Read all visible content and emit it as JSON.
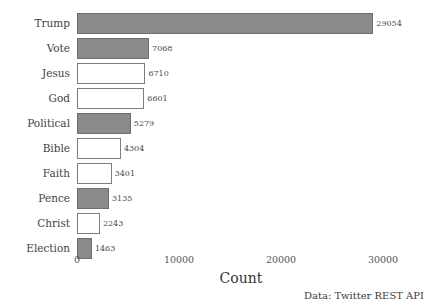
{
  "chart_data": {
    "type": "bar",
    "orientation": "horizontal",
    "title": "",
    "xlabel": "Count",
    "ylabel": "",
    "xlim": [
      0,
      30000
    ],
    "xticks": [
      "0",
      "10000",
      "20000",
      "30000"
    ],
    "xtick_values": [
      0,
      10000,
      20000,
      30000
    ],
    "grid": false,
    "legend": null,
    "annotation": "Data: Twitter REST API",
    "categories": [
      "Trump",
      "Vote",
      "Jesus",
      "God",
      "Political",
      "Bible",
      "Faith",
      "Pence",
      "Christ",
      "Election"
    ],
    "values": [
      29054,
      7068,
      6710,
      6601,
      5279,
      4304,
      3401,
      3135,
      2243,
      1463
    ],
    "value_labels": [
      "29054",
      "7068",
      "6710",
      "6601",
      "5279",
      "4304",
      "3401",
      "3135",
      "2243",
      "1463"
    ],
    "bar_styles": [
      "filled",
      "filled",
      "hollow",
      "hollow",
      "filled",
      "hollow",
      "hollow",
      "filled",
      "hollow",
      "filled"
    ],
    "colors": {
      "filled": "#8a8a8a",
      "hollow": "#ffffff",
      "border": "#7d7d7d",
      "text": "#3d3d3d",
      "background": "#ffffff"
    }
  }
}
